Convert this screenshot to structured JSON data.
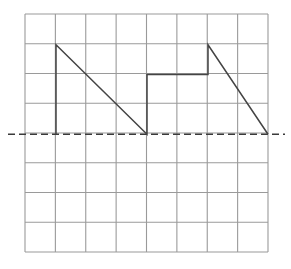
{
  "figure": {
    "background_color": "#ffffff",
    "width": 291,
    "height": 269
  },
  "grid": {
    "label": "graph-paper-grid",
    "columns": 8,
    "rows": 8,
    "x_start": 25,
    "y_start": 14,
    "x_end": 268,
    "y_end": 252,
    "cell_width": 30.375,
    "cell_height": 29.75,
    "line_color": "#9a9a9a",
    "line_width": 1.1
  },
  "zero_line": {
    "label": "zero-reference-line",
    "y": 134.25,
    "x_start": 8,
    "x_end": 285,
    "color": "#3a3a3a",
    "line_width": 1.6,
    "dash": "7 4"
  },
  "trace": {
    "label": "waveform-trace",
    "color": "#444444",
    "line_width": 1.5,
    "points": "56,134.25 56,44.75 147,134.25 147,74.5 208,74.5 208,44.75 268,134.25"
  },
  "chart_data": {
    "type": "line",
    "xlabel": "",
    "ylabel": "",
    "grid": true,
    "legend": "none",
    "xlim": [
      0,
      8
    ],
    "ylim": [
      -4,
      4
    ],
    "axis_note": "Grid divisions in arbitrary units; dashed horizontal line marks zero level at row 4 from top.",
    "series": [
      {
        "name": "signal",
        "description": "Two ramp (sawtooth) cycles falling to zero, the second preceded by a stepped rise",
        "x": [
          1.0,
          1.0,
          4.0,
          4.0,
          6.0,
          6.0,
          8.0
        ],
        "y": [
          0.0,
          3.0,
          0.0,
          2.0,
          2.0,
          3.0,
          0.0
        ]
      }
    ],
    "annotations": [
      {
        "name": "zero-line",
        "type": "hline",
        "y": 0,
        "style": "dashed"
      }
    ]
  }
}
